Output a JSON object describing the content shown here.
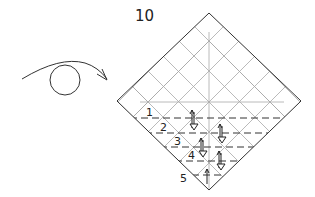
{
  "diagram": {
    "type": "origami-step",
    "step_number": "10",
    "turn_over_symbol": "turn-over-arrow-icon",
    "paper": {
      "shape": "diamond",
      "vertices": {
        "top": [
          209,
          13
        ],
        "left": [
          117,
          101
        ],
        "right": [
          301,
          101
        ],
        "bottom": [
          209,
          190
        ]
      },
      "stroke": "#333333"
    },
    "crease_grid": {
      "color": "#9a9a9a",
      "spacing": 30.5
    },
    "pleat_lines": [
      {
        "label": "1",
        "y": 118
      },
      {
        "label": "2",
        "y": 133
      },
      {
        "label": "3",
        "y": 147
      },
      {
        "label": "4",
        "y": 161
      },
      {
        "label": "5",
        "y": 175
      }
    ],
    "arrows": [
      {
        "x": 193,
        "y1": 110,
        "y2": 128
      },
      {
        "x": 221,
        "y1": 124,
        "y2": 142
      },
      {
        "x": 201,
        "y1": 138,
        "y2": 156
      },
      {
        "x": 220,
        "y1": 152,
        "y2": 170
      },
      {
        "x": 207,
        "y1": 168,
        "y2": 182
      }
    ],
    "line_color": "#333333"
  }
}
